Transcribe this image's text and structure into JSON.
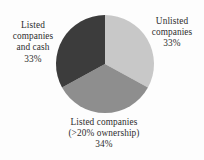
{
  "chart_data": {
    "type": "pie",
    "title": "",
    "subtitle": "",
    "xlabel": "",
    "ylabel": "",
    "legend_position": "none",
    "grid": false,
    "value_unit": "percent",
    "categories": [
      "Unlisted companies",
      "Listed companies (>20% ownership)",
      "Listed companies and cash"
    ],
    "values": [
      33,
      34,
      33
    ],
    "slices": [
      {
        "name": "Unlisted companies",
        "value": 33,
        "value_label": "33%",
        "color": "#c8c8c8",
        "start_angle_deg": 0,
        "end_angle_deg": 118.8,
        "label_position": "right",
        "label_lines": [
          "Unlisted",
          "companies",
          "33%"
        ]
      },
      {
        "name": "Listed companies (>20% ownership)",
        "value": 34,
        "value_label": "34%",
        "color": "#8e8e8e",
        "start_angle_deg": 118.8,
        "end_angle_deg": 241.2,
        "label_position": "bottom",
        "label_lines": [
          "Listed companies",
          "(>20% ownership)",
          "34%"
        ]
      },
      {
        "name": "Listed companies and cash",
        "value": 33,
        "value_label": "33%",
        "color": "#3c3c3c",
        "start_angle_deg": 241.2,
        "end_angle_deg": 360,
        "label_position": "left",
        "label_lines": [
          "Listed",
          "companies",
          "and cash",
          "33%"
        ]
      }
    ],
    "geometry": {
      "center_x": 105,
      "center_y": 64,
      "radius": 49
    },
    "background_color": "#fdfdfd",
    "text_color": "#2e2e2e"
  },
  "labels": {
    "unlisted": {
      "line1": "Unlisted",
      "line2": "companies",
      "line3": "33%"
    },
    "listed_ownership": {
      "line1": "Listed companies",
      "line2": "(>20% ownership)",
      "line3": "34%"
    },
    "listed_and_cash": {
      "line1": "Listed",
      "line2": "companies",
      "line3": "and cash",
      "line4": "33%"
    }
  }
}
